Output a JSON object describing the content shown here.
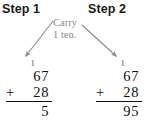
{
  "figure": {
    "title_step1": "Step 1",
    "title_step2": "Step 2",
    "annotation": {
      "line1": "Carry",
      "line2": "1 ten.",
      "color": "#8c8c8c"
    },
    "arrow_color": "#8a8a8a",
    "text_color": "#111111"
  },
  "steps": [
    {
      "heading": "Step 1",
      "carry_digit": "1",
      "top_addend": "67",
      "operator": "+",
      "bottom_addend": "28",
      "sum": "5"
    },
    {
      "heading": "Step 2",
      "carry_digit": "1",
      "top_addend": "67",
      "operator": "+",
      "bottom_addend": "28",
      "sum": "95"
    }
  ]
}
